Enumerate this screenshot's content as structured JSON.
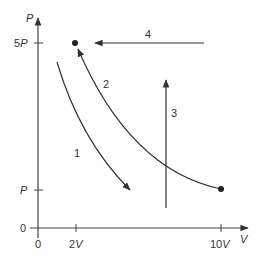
{
  "diagram": {
    "type": "PV diagram",
    "axes": {
      "y_label": "P",
      "x_label": "V",
      "y_ticks": [
        {
          "label": "5P",
          "value": "5P"
        },
        {
          "label": "P",
          "value": "P"
        },
        {
          "label": "0",
          "value": "0"
        }
      ],
      "x_ticks": [
        {
          "label": "0",
          "value": "0"
        },
        {
          "label": "2V",
          "value": "2V"
        },
        {
          "label": "10V",
          "value": "10V"
        }
      ]
    },
    "points": [
      {
        "name": "state-a",
        "V": "2V",
        "P": "5P"
      },
      {
        "name": "state-b",
        "V": "10V",
        "P": "P"
      }
    ],
    "paths": [
      {
        "label": "1",
        "description": "curved path downward to the right, not passing through endpoints"
      },
      {
        "label": "2",
        "description": "curve from (10V, P) up to (2V, 5P)"
      },
      {
        "label": "3",
        "description": "vertical upward arrow"
      },
      {
        "label": "4",
        "description": "horizontal leftward arrow toward (2V, 5P)"
      }
    ],
    "colors": {
      "line": "#333333",
      "background": "#ffffff"
    }
  }
}
